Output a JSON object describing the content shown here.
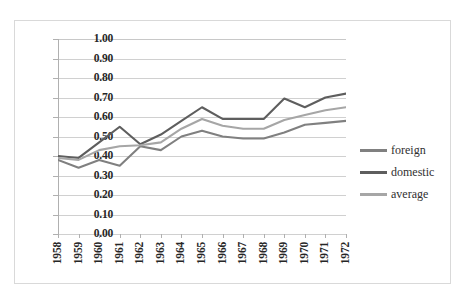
{
  "chart_data": {
    "type": "line",
    "title": "",
    "subtitle": "",
    "xlabel": "",
    "ylabel": "",
    "categories": [
      "1958",
      "1959",
      "1960",
      "1961",
      "1962",
      "1963",
      "1964",
      "1965",
      "1966",
      "1967",
      "1968",
      "1969",
      "1970",
      "1971",
      "1972"
    ],
    "ylim": [
      0.0,
      1.0
    ],
    "ytick_labels": [
      "1.00",
      "0.90",
      "0.80",
      "0.70",
      "0.60",
      "0.50",
      "0.40",
      "0.30",
      "0.20",
      "0.10",
      "0.00"
    ],
    "ytick_values": [
      1.0,
      0.9,
      0.8,
      0.7,
      0.6,
      0.5,
      0.4,
      0.3,
      0.2,
      0.1,
      0.0
    ],
    "grid": "horizontal",
    "legend_position": "right",
    "series": [
      {
        "name": "foreign",
        "color": "#808080",
        "values": [
          0.38,
          0.34,
          0.38,
          0.35,
          0.45,
          0.43,
          0.5,
          0.53,
          0.5,
          0.49,
          0.49,
          0.52,
          0.56,
          0.57,
          0.58
        ]
      },
      {
        "name": "domestic",
        "color": "#5e5e5e",
        "values": [
          0.4,
          0.39,
          0.47,
          0.55,
          0.46,
          0.51,
          0.58,
          0.65,
          0.59,
          0.59,
          0.59,
          0.695,
          0.65,
          0.7,
          0.72
        ]
      },
      {
        "name": "average",
        "color": "#a6a6a6",
        "values": [
          0.39,
          0.38,
          0.43,
          0.45,
          0.455,
          0.47,
          0.54,
          0.59,
          0.555,
          0.54,
          0.54,
          0.585,
          0.61,
          0.635,
          0.65
        ]
      }
    ]
  },
  "legend": {
    "items": [
      {
        "label": "foreign",
        "color": "#808080"
      },
      {
        "label": "domestic",
        "color": "#5e5e5e"
      },
      {
        "label": "average",
        "color": "#a6a6a6"
      }
    ]
  }
}
